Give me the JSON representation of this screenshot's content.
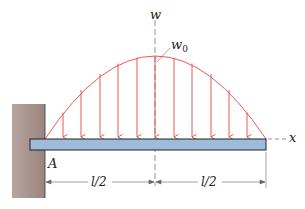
{
  "diagram": {
    "type": "cantilever beam with parabolic distributed load",
    "labels": {
      "w_axis": "w",
      "x_axis": "x",
      "peak_load": "w",
      "peak_load_sub": "0",
      "support": "A",
      "dim_left": "l/2",
      "dim_right": "l/2"
    },
    "colors": {
      "load": "#e8473f",
      "beam_fill": "#9dbcd9",
      "beam_stroke": "#222222",
      "wall_fill": "#a08c85",
      "dim_line": "#555555"
    },
    "load_arrows_count": 11
  }
}
